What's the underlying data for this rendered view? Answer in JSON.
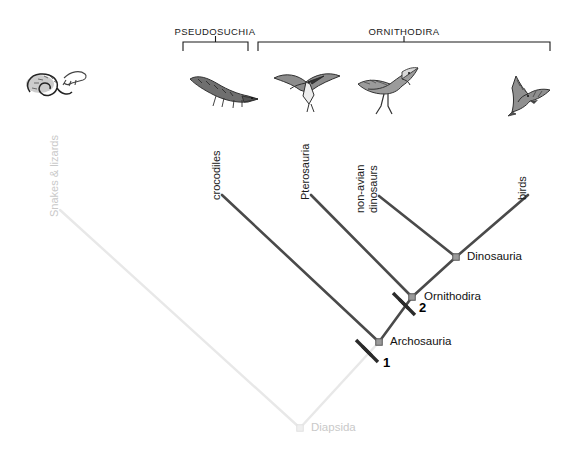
{
  "figure": {
    "type": "cladogram",
    "title": "",
    "background": "#ffffff",
    "branch_color": "#4a4a4a",
    "faded_color": "#e8e8e8",
    "faded_text_color": "#c9c9c9",
    "node_fill": "#9a9a9a",
    "mark_color": "#2b2b2b"
  },
  "brackets": [
    {
      "label": "PSEUDOSUCHIA",
      "x_start": 183,
      "x_end": 248,
      "y": 42,
      "label_x": 215,
      "label_y": 26
    },
    {
      "label": "ORNITHODIRA",
      "x_start": 258,
      "x_end": 550,
      "y": 42,
      "label_x": 404,
      "label_y": 26
    }
  ],
  "tips": [
    {
      "name": "snakes-lizards",
      "label": "Snakes & lizards",
      "lines": [
        "Snakes & lizards"
      ],
      "x": 60,
      "y": 205,
      "faded": true
    },
    {
      "name": "crocodiles",
      "label": "crocodiles",
      "lines": [
        "crocodiles"
      ],
      "x": 222,
      "y": 188,
      "faded": false
    },
    {
      "name": "pterosauria",
      "label": "Pterosauria",
      "lines": [
        "Pterosauria"
      ],
      "x": 311,
      "y": 188,
      "faded": false
    },
    {
      "name": "non-avian-dinosaurs",
      "label": "non-avian dinosaurs",
      "lines": [
        "non-avian",
        "dinosaurs"
      ],
      "x": 379,
      "y": 188,
      "faded": false
    },
    {
      "name": "birds",
      "label": "birds",
      "lines": [
        "birds"
      ],
      "x": 528,
      "y": 188,
      "faded": false
    }
  ],
  "nodes": [
    {
      "name": "diapsida",
      "label": "Diapsida",
      "x": 300,
      "y": 428,
      "label_x": 311,
      "label_y": 421,
      "faded": true
    },
    {
      "name": "archosauria",
      "label": "Archosauria",
      "x": 379,
      "y": 342,
      "label_x": 390,
      "label_y": 335,
      "faded": false
    },
    {
      "name": "ornithodira",
      "label": "Ornithodira",
      "x": 412,
      "y": 297,
      "label_x": 424,
      "label_y": 290,
      "faded": false
    },
    {
      "name": "dinosauria",
      "label": "Dinosauria",
      "x": 456,
      "y": 257,
      "label_x": 467,
      "label_y": 250,
      "faded": false
    }
  ],
  "character_marks": [
    {
      "name": "mark-1",
      "number": "1",
      "x": 367,
      "y": 351,
      "num_x": 383,
      "num_y": 355
    },
    {
      "name": "mark-2",
      "number": "2",
      "x": 404,
      "y": 304,
      "num_x": 419,
      "num_y": 300
    }
  ],
  "branches": [
    {
      "name": "branch-diapsida-to-snakes",
      "from": [
        300,
        428
      ],
      "to": [
        60,
        210
      ],
      "faded": true
    },
    {
      "name": "branch-diapsida-to-archosauria",
      "from": [
        300,
        428
      ],
      "to": [
        379,
        342
      ],
      "faded": true
    },
    {
      "name": "branch-archosauria-to-crocodiles",
      "from": [
        379,
        342
      ],
      "to": [
        222,
        195
      ],
      "faded": false
    },
    {
      "name": "branch-archosauria-to-ornithodira",
      "from": [
        379,
        342
      ],
      "to": [
        412,
        297
      ],
      "faded": false
    },
    {
      "name": "branch-ornithodira-to-pterosauria",
      "from": [
        412,
        297
      ],
      "to": [
        311,
        195
      ],
      "faded": false
    },
    {
      "name": "branch-ornithodira-to-dinosauria",
      "from": [
        412,
        297
      ],
      "to": [
        456,
        257
      ],
      "faded": false
    },
    {
      "name": "branch-dinosauria-to-nonavian",
      "from": [
        456,
        257
      ],
      "to": [
        379,
        196
      ],
      "faded": false
    },
    {
      "name": "branch-dinosauria-to-birds",
      "from": [
        456,
        257
      ],
      "to": [
        528,
        195
      ],
      "faded": false
    }
  ],
  "illustrations": [
    {
      "name": "snake-lizard-illustration",
      "x": 14,
      "y": 58,
      "w": 76,
      "h": 52
    },
    {
      "name": "crocodile-illustration",
      "x": 186,
      "y": 66,
      "w": 74,
      "h": 46
    },
    {
      "name": "pterosaur-illustration",
      "x": 270,
      "y": 62,
      "w": 74,
      "h": 52
    },
    {
      "name": "theropod-dinosaur-illustration",
      "x": 354,
      "y": 58,
      "w": 76,
      "h": 58
    },
    {
      "name": "bird-illustration",
      "x": 498,
      "y": 70,
      "w": 62,
      "h": 48
    }
  ]
}
